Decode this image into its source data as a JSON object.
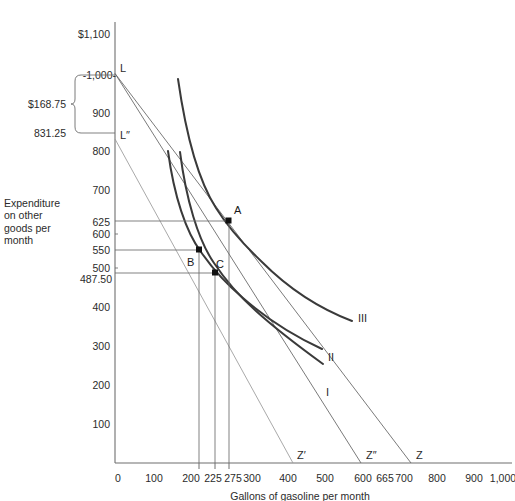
{
  "axes": {
    "y_axis_title": "Expenditure on other goods per month",
    "y_axis_title_lines": [
      "Expenditure",
      "on other",
      "goods per",
      "month"
    ],
    "x_axis_title": "Gallons of gasoline per month",
    "y_ticks": [
      {
        "label": "$1,100",
        "value": 1100
      },
      {
        "label": "-1,000-",
        "value": 1000
      },
      {
        "label": "900",
        "value": 900
      },
      {
        "label": "800",
        "value": 800
      },
      {
        "label": "700",
        "value": 700
      },
      {
        "label": "625",
        "value": 625
      },
      {
        "label": "600",
        "value": 600
      },
      {
        "label": "550",
        "value": 550
      },
      {
        "label": "500",
        "value": 500
      },
      {
        "label": "487.50",
        "value": 487.5
      },
      {
        "label": "400",
        "value": 400
      },
      {
        "label": "300",
        "value": 300
      },
      {
        "label": "200",
        "value": 200
      },
      {
        "label": "100",
        "value": 100
      }
    ],
    "x_ticks": [
      {
        "label": "0",
        "value": 0
      },
      {
        "label": "100",
        "value": 100
      },
      {
        "label": "200",
        "value": 200
      },
      {
        "label": "225",
        "value": 225
      },
      {
        "label": "275",
        "value": 275
      },
      {
        "label": "300",
        "value": 300
      },
      {
        "label": "400",
        "value": 400
      },
      {
        "label": "500",
        "value": 500
      },
      {
        "label": "600",
        "value": 600
      },
      {
        "label": "665",
        "value": 665
      },
      {
        "label": "700",
        "value": 700
      },
      {
        "label": "800",
        "value": 800
      },
      {
        "label": "900",
        "value": 900
      },
      {
        "label": "1,000",
        "value": 1000
      }
    ],
    "xlim": [
      0,
      1050
    ],
    "ylim": [
      0,
      1140
    ]
  },
  "bracket": {
    "amount_label": "$168.75",
    "lower_label": "831.25",
    "top_value": 1000,
    "bottom_value": 831.25
  },
  "budget_lines": [
    {
      "name": "L",
      "label": "L",
      "endpoint_label": "Z",
      "intercept_y": 1000,
      "intercept_x": 800
    },
    {
      "name": "L2",
      "label": "",
      "endpoint_label": "Z″",
      "intercept_y": 1000,
      "intercept_x": 665
    },
    {
      "name": "L3",
      "label": "L″",
      "endpoint_label": "Z′",
      "intercept_y": 831.25,
      "intercept_x": 480
    }
  ],
  "axis_endpoint_labels": [
    {
      "label": "Z′",
      "x": 480
    },
    {
      "label": "Z″",
      "x": 665
    },
    {
      "label": "Z",
      "x": 800
    }
  ],
  "indifference_curves": [
    {
      "label": "I",
      "name": "indifference-curve-i"
    },
    {
      "label": "II",
      "name": "indifference-curve-ii"
    },
    {
      "label": "III",
      "name": "indifference-curve-iii"
    }
  ],
  "points": [
    {
      "label": "A",
      "x": 290,
      "y": 625,
      "name": "point-a"
    },
    {
      "label": "B",
      "x": 217,
      "y": 550,
      "name": "point-b"
    },
    {
      "label": "C",
      "x": 258,
      "y": 487.5,
      "name": "point-c"
    }
  ],
  "colors": {
    "axis": "#6f6f6f",
    "guide": "#6b6b6b",
    "indifference": "#3a3a3a",
    "text": "#2b2b2b",
    "background": "#ffffff"
  }
}
